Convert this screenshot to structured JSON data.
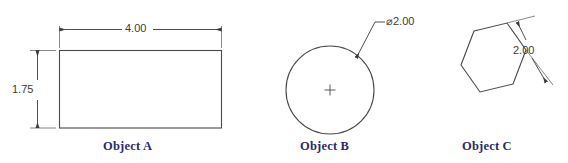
{
  "figure": {
    "background_color": "#ffffff",
    "line_color": "#4a4a4a",
    "label_color": "#2a2a6e",
    "dim_text_color": "#3b3b3b"
  },
  "objects": [
    {
      "id": "object-a",
      "label": "Object A",
      "shape": "rectangle",
      "dimensions": [
        {
          "name": "width",
          "value": "4.00",
          "orientation": "horizontal",
          "position": "above"
        },
        {
          "name": "height",
          "value": "1.75",
          "orientation": "vertical",
          "position": "left"
        }
      ]
    },
    {
      "id": "object-b",
      "label": "Object B",
      "shape": "circle",
      "center_mark": "+",
      "dimensions": [
        {
          "name": "diameter",
          "value": "⌀2.00",
          "orientation": "leader",
          "position": "upper-right"
        }
      ]
    },
    {
      "id": "object-c",
      "label": "Object C",
      "shape": "hexagon",
      "dimensions": [
        {
          "name": "edge",
          "value": "2.00",
          "orientation": "aligned",
          "position": "upper-right"
        }
      ]
    }
  ],
  "labels": {
    "object_a": "Object A",
    "object_b": "Object B",
    "object_c": "Object C"
  },
  "dimension_values": {
    "rect_width": "4.00",
    "rect_height": "1.75",
    "circle_diameter": "⌀2.00",
    "hex_edge": "2.00"
  }
}
